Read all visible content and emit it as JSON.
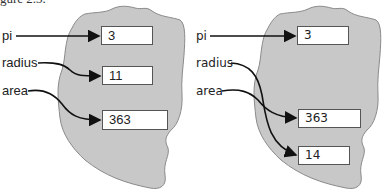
{
  "caption": "gure 2.3.",
  "panels": [
    {
      "name": "before",
      "variables": [
        {
          "label": "pi",
          "value": "3"
        },
        {
          "label": "radius",
          "value": "11"
        },
        {
          "label": "area",
          "value": "363"
        }
      ]
    },
    {
      "name": "after",
      "variables": [
        {
          "label": "pi",
          "value": "3"
        },
        {
          "label": "radius",
          "value": "14"
        },
        {
          "label": "area",
          "value": "363"
        }
      ],
      "box_order": [
        "3",
        "363",
        "14"
      ]
    }
  ],
  "colors": {
    "blob_fill": "#c8c8c8",
    "blob_stroke": "#8a8a8a",
    "arrow": "#111111",
    "box_fill": "#ffffff"
  }
}
